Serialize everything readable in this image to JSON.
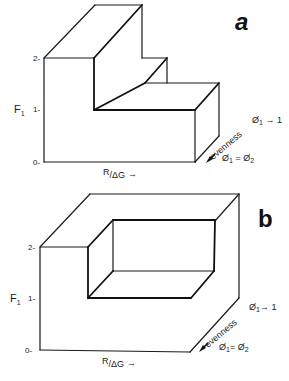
{
  "figure": {
    "panels": [
      {
        "id": "a",
        "label": "a",
        "y_axis": {
          "label": "F",
          "label_subscript": "1",
          "ticks": [
            "2-",
            "1-",
            "0-"
          ]
        },
        "x_axis": {
          "label_r": "R",
          "label_dg": "/ΔG",
          "arrow": "→"
        },
        "depth_axis": {
          "label": "evenness",
          "near_label_phi1": "Ø",
          "near_label_sub1": "1",
          "near_label_eq": " = Ø",
          "near_label_sub2": "2",
          "far_label_phi": "Ø",
          "far_label_sub": "1",
          "far_label_rest": " → 1"
        }
      },
      {
        "id": "b",
        "label": "b",
        "y_axis": {
          "label": "F",
          "label_subscript": "1",
          "ticks": [
            "2-",
            "1-",
            "0-"
          ]
        },
        "x_axis": {
          "label_r": "R",
          "label_dg": "/ΔG",
          "arrow": "→"
        },
        "depth_axis": {
          "label": "evenness",
          "near_label_phi1": "Ø",
          "near_label_sub1": "1",
          "near_label_eq": "= Ø",
          "near_label_sub2": "2",
          "far_label_phi": "Ø",
          "far_label_sub": "1",
          "far_label_rest": "→ 1"
        }
      }
    ]
  }
}
